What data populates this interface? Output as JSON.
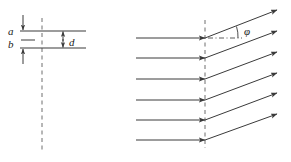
{
  "figure": {
    "background_color": "#ffffff",
    "line_color": "#3a3a3a",
    "text_color": "#1a1a1a",
    "width": 291,
    "height": 162
  },
  "left_panel": {
    "name": "lattice-planes-panel",
    "description": "Two parallel horizontal lattice planes labelled a and b, separated by spacing d, crossed by a vertical dashed line.",
    "plane_a": {
      "label": "a",
      "label_x": 8,
      "label_y": 34,
      "line_y": 31,
      "line_x1": 20,
      "line_x2": 86
    },
    "plane_b": {
      "label": "b",
      "label_x": 8,
      "label_y": 47,
      "line_y": 48,
      "line_x1": 20,
      "line_x2": 86
    },
    "spacing": {
      "label": "d",
      "label_x": 70,
      "label_y": 45,
      "arrow_x": 63,
      "arrow_top_y": 31,
      "arrow_bottom_y": 48
    },
    "short_dash": {
      "x1": 21,
      "x2": 35,
      "y": 40
    },
    "top_arrow": {
      "x": 23,
      "from_y": 15,
      "to_y": 31
    },
    "bottom_arrow": {
      "x": 23,
      "from_y": 64,
      "to_y": 48
    },
    "dashed_vertical": {
      "x": 42,
      "y1": 18,
      "y2": 150
    }
  },
  "right_panel": {
    "name": "ray-deflection-panel",
    "description": "Six parallel horizontal incident rays meeting a vertical dashed boundary and emerging deflected upward at angle phi.",
    "dashed_vertical": {
      "x": 205,
      "y1": 20,
      "y2": 148
    },
    "incident_rays": {
      "start_x": 136,
      "end_x": 205,
      "y_values": [
        38,
        58,
        79,
        100,
        120,
        140
      ]
    },
    "outgoing_rays": {
      "start_x": 205,
      "end_x": 277,
      "start_y_values": [
        38,
        58,
        79,
        100,
        120,
        140
      ],
      "end_y_values": [
        10,
        31,
        52,
        73,
        93,
        114
      ]
    },
    "angle": {
      "symbol": "φ",
      "label_x": 245,
      "label_y": 33,
      "reference_line": {
        "x1": 208,
        "x2": 242,
        "y": 38,
        "style": "dash-dot"
      },
      "arc_center_x": 205,
      "arc_center_y": 38,
      "arc_radius": 33
    }
  }
}
